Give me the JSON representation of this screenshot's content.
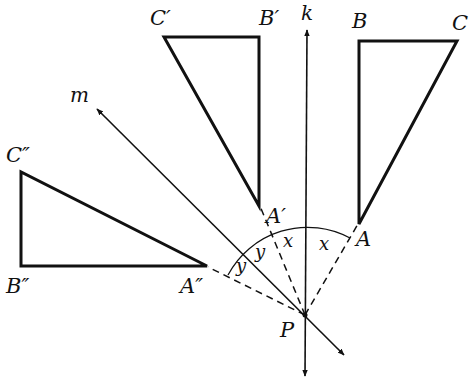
{
  "diagram": {
    "type": "geometry-rotation",
    "lines": {
      "k": "k",
      "m": "m"
    },
    "center": "P",
    "triangle_original": {
      "A": "A",
      "B": "B",
      "C": "C"
    },
    "triangle_first_image": {
      "A": "A′",
      "B": "B′",
      "C": "C′"
    },
    "triangle_second_image": {
      "A": "A″",
      "B": "B″",
      "C": "C″"
    },
    "angles": {
      "x1": "x",
      "x2": "x",
      "y1": "y",
      "y2": "y"
    },
    "colors": {
      "stroke": "#111111",
      "background": "#ffffff"
    }
  }
}
